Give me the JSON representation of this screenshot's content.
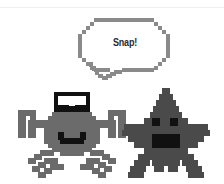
{
  "scene": {
    "title": "Crab and starfish pixel art",
    "background_color": "#ffffff",
    "width": 224,
    "height": 184
  },
  "divider": {
    "name": "top-rule",
    "color": "#f0f0f2"
  },
  "speech_bubble": {
    "text": "Snap!",
    "text_color": "#2b2b2b",
    "outline_color": "#8a8a8a",
    "fill_color": "#ffffff",
    "tail_direction": "down-left",
    "speaker": "crab"
  },
  "characters": [
    {
      "name": "crab",
      "body_color": "#6b6b6b",
      "eye_color": "#111111",
      "pupil_color": "#ffffff",
      "mouth_color": "#111111",
      "mouth_shape": "smile",
      "eyes": 2,
      "claws": 2,
      "legs": 6
    },
    {
      "name": "starfish",
      "body_color": "#4a4a4a",
      "eye_color": "#111111",
      "mouth_color": "#111111",
      "mouth_shape": "rectangle",
      "eyes": 2,
      "arms": 5
    }
  ],
  "palette": {
    "crab_body": "#6b6b6b",
    "starfish_body": "#4a4a4a",
    "bubble_outline": "#8a8a8a",
    "black": "#111111",
    "white": "#ffffff"
  }
}
